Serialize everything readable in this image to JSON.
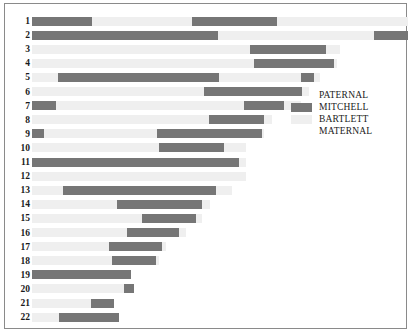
{
  "chart_data": {
    "type": "bar",
    "title": "",
    "subtitle": "",
    "xlabel": "",
    "ylabel": "",
    "grid": false,
    "legend_position": "right-middle",
    "categories": [
      "1",
      "2",
      "3",
      "4",
      "5",
      "6",
      "7",
      "8",
      "9",
      "10",
      "11",
      "12",
      "13",
      "14",
      "15",
      "16",
      "17",
      "18",
      "19",
      "20",
      "21",
      "22"
    ],
    "colors": {
      "mitchell": "#767676",
      "bartlett": "#efefef",
      "paternal": "#767676",
      "maternal": "#efefef",
      "frame": "#8a8a8a",
      "background": "#ffffff",
      "text": "#1a1a1a"
    },
    "legend": [
      {
        "label": "PATERNAL",
        "swatch": "none"
      },
      {
        "label": "MITCHELL",
        "swatch": "dark"
      },
      {
        "label": "BARTLETT",
        "swatch": "light"
      },
      {
        "label": "MATERNAL",
        "swatch": "none"
      }
    ],
    "axis_units": "relative chromosome length (px)",
    "xlim": [
      0,
      376
    ],
    "rows": [
      {
        "chrom": "1",
        "total": 376,
        "segments": [
          {
            "start": 0,
            "end": 60,
            "type": "mitchell"
          },
          {
            "start": 60,
            "end": 160,
            "type": "bartlett"
          },
          {
            "start": 160,
            "end": 245,
            "type": "mitchell"
          },
          {
            "start": 245,
            "end": 376,
            "type": "bartlett"
          }
        ]
      },
      {
        "chrom": "2",
        "total": 376,
        "segments": [
          {
            "start": 0,
            "end": 186,
            "type": "mitchell"
          },
          {
            "start": 186,
            "end": 342,
            "type": "bartlett"
          },
          {
            "start": 342,
            "end": 376,
            "type": "mitchell"
          }
        ]
      },
      {
        "chrom": "3",
        "total": 308,
        "segments": [
          {
            "start": 0,
            "end": 218,
            "type": "bartlett"
          },
          {
            "start": 218,
            "end": 294,
            "type": "mitchell"
          },
          {
            "start": 294,
            "end": 308,
            "type": "bartlett"
          }
        ]
      },
      {
        "chrom": "4",
        "total": 305,
        "segments": [
          {
            "start": 0,
            "end": 222,
            "type": "bartlett"
          },
          {
            "start": 222,
            "end": 302,
            "type": "mitchell"
          },
          {
            "start": 302,
            "end": 305,
            "type": "bartlett"
          }
        ]
      },
      {
        "chrom": "5",
        "total": 288,
        "segments": [
          {
            "start": 0,
            "end": 26,
            "type": "bartlett"
          },
          {
            "start": 26,
            "end": 187,
            "type": "mitchell"
          },
          {
            "start": 187,
            "end": 269,
            "type": "bartlett"
          },
          {
            "start": 269,
            "end": 282,
            "type": "mitchell"
          },
          {
            "start": 282,
            "end": 288,
            "type": "bartlett"
          }
        ]
      },
      {
        "chrom": "6",
        "total": 277,
        "segments": [
          {
            "start": 0,
            "end": 172,
            "type": "bartlett"
          },
          {
            "start": 172,
            "end": 270,
            "type": "mitchell"
          },
          {
            "start": 270,
            "end": 277,
            "type": "bartlett"
          }
        ]
      },
      {
        "chrom": "7",
        "total": 269,
        "segments": [
          {
            "start": 0,
            "end": 24,
            "type": "mitchell"
          },
          {
            "start": 24,
            "end": 212,
            "type": "bartlett"
          },
          {
            "start": 212,
            "end": 252,
            "type": "mitchell"
          },
          {
            "start": 252,
            "end": 269,
            "type": "bartlett"
          }
        ]
      },
      {
        "chrom": "8",
        "total": 240,
        "segments": [
          {
            "start": 0,
            "end": 177,
            "type": "bartlett"
          },
          {
            "start": 177,
            "end": 232,
            "type": "mitchell"
          },
          {
            "start": 232,
            "end": 240,
            "type": "bartlett"
          }
        ]
      },
      {
        "chrom": "9",
        "total": 232,
        "segments": [
          {
            "start": 0,
            "end": 12,
            "type": "mitchell"
          },
          {
            "start": 12,
            "end": 125,
            "type": "bartlett"
          },
          {
            "start": 125,
            "end": 230,
            "type": "mitchell"
          },
          {
            "start": 230,
            "end": 232,
            "type": "bartlett"
          }
        ]
      },
      {
        "chrom": "10",
        "total": 214,
        "segments": [
          {
            "start": 0,
            "end": 127,
            "type": "bartlett"
          },
          {
            "start": 127,
            "end": 192,
            "type": "mitchell"
          },
          {
            "start": 192,
            "end": 214,
            "type": "bartlett"
          }
        ]
      },
      {
        "chrom": "11",
        "total": 214,
        "segments": [
          {
            "start": 0,
            "end": 207,
            "type": "mitchell"
          },
          {
            "start": 207,
            "end": 214,
            "type": "bartlett"
          }
        ]
      },
      {
        "chrom": "12",
        "total": 214,
        "segments": [
          {
            "start": 0,
            "end": 214,
            "type": "bartlett"
          }
        ]
      },
      {
        "chrom": "13",
        "total": 200,
        "segments": [
          {
            "start": 0,
            "end": 31,
            "type": "bartlett"
          },
          {
            "start": 31,
            "end": 184,
            "type": "mitchell"
          },
          {
            "start": 184,
            "end": 200,
            "type": "bartlett"
          }
        ]
      },
      {
        "chrom": "14",
        "total": 178,
        "segments": [
          {
            "start": 0,
            "end": 85,
            "type": "bartlett"
          },
          {
            "start": 85,
            "end": 170,
            "type": "mitchell"
          },
          {
            "start": 170,
            "end": 178,
            "type": "bartlett"
          }
        ]
      },
      {
        "chrom": "15",
        "total": 170,
        "segments": [
          {
            "start": 0,
            "end": 110,
            "type": "bartlett"
          },
          {
            "start": 110,
            "end": 164,
            "type": "mitchell"
          },
          {
            "start": 164,
            "end": 170,
            "type": "bartlett"
          }
        ]
      },
      {
        "chrom": "16",
        "total": 154,
        "segments": [
          {
            "start": 0,
            "end": 95,
            "type": "bartlett"
          },
          {
            "start": 95,
            "end": 147,
            "type": "mitchell"
          },
          {
            "start": 147,
            "end": 154,
            "type": "bartlett"
          }
        ]
      },
      {
        "chrom": "17",
        "total": 134,
        "segments": [
          {
            "start": 0,
            "end": 77,
            "type": "bartlett"
          },
          {
            "start": 77,
            "end": 130,
            "type": "mitchell"
          },
          {
            "start": 130,
            "end": 134,
            "type": "bartlett"
          }
        ]
      },
      {
        "chrom": "18",
        "total": 127,
        "segments": [
          {
            "start": 0,
            "end": 80,
            "type": "bartlett"
          },
          {
            "start": 80,
            "end": 124,
            "type": "mitchell"
          },
          {
            "start": 124,
            "end": 127,
            "type": "bartlett"
          }
        ]
      },
      {
        "chrom": "19",
        "total": 99,
        "segments": [
          {
            "start": 0,
            "end": 99,
            "type": "mitchell"
          }
        ]
      },
      {
        "chrom": "20",
        "total": 102,
        "segments": [
          {
            "start": 0,
            "end": 92,
            "type": "bartlett"
          },
          {
            "start": 92,
            "end": 102,
            "type": "mitchell"
          }
        ]
      },
      {
        "chrom": "21",
        "total": 82,
        "segments": [
          {
            "start": 0,
            "end": 59,
            "type": "bartlett"
          },
          {
            "start": 59,
            "end": 82,
            "type": "mitchell"
          }
        ]
      },
      {
        "chrom": "22",
        "total": 87,
        "segments": [
          {
            "start": 0,
            "end": 27,
            "type": "bartlett"
          },
          {
            "start": 27,
            "end": 87,
            "type": "mitchell"
          }
        ]
      }
    ]
  }
}
